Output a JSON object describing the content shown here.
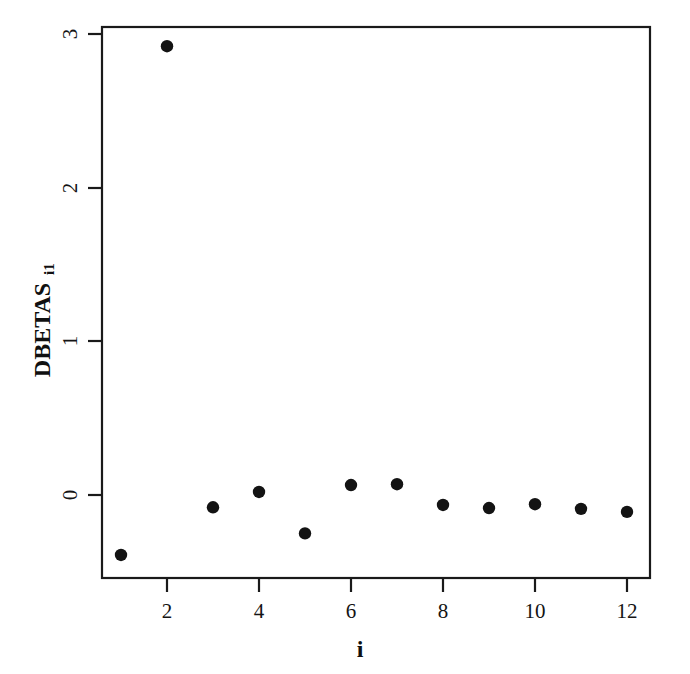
{
  "figure": {
    "background_color": "#ffffff",
    "ink_color": "#131313"
  },
  "axes": {
    "y_title_main": "DBETAS",
    "y_title_subscript": "i1",
    "x_title": "i",
    "y_tick_labels": [
      "0",
      "1",
      "2",
      "3"
    ],
    "x_tick_labels": [
      "2",
      "4",
      "6",
      "8",
      "10",
      "12"
    ]
  },
  "chart_data": {
    "type": "scatter",
    "title": "",
    "xlabel": "i",
    "ylabel": "DBETAS_i1",
    "grid": false,
    "legend": null,
    "xlim": [
      0.55,
      12.45
    ],
    "ylim": [
      -0.54,
      3.15
    ],
    "x_ticks": [
      2,
      4,
      6,
      8,
      10,
      12
    ],
    "y_ticks": [
      0,
      1,
      2,
      3
    ],
    "x": [
      1,
      2,
      3,
      4,
      5,
      6,
      7,
      8,
      9,
      10,
      11,
      12
    ],
    "values": [
      -0.39,
      2.92,
      -0.08,
      0.02,
      -0.25,
      0.065,
      0.07,
      -0.065,
      -0.085,
      -0.06,
      -0.09,
      -0.11
    ],
    "point_marker": "filled-circle",
    "point_size_px": 6.2
  }
}
